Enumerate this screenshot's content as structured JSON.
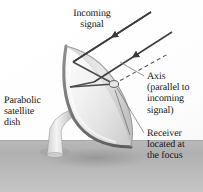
{
  "figure": {
    "background_color": "#ffffff",
    "ground_color": "#b4b4b4",
    "ink_color": "#141414",
    "dish_color": "#e8e8e8",
    "ray_color": "#4a4a4a"
  },
  "labels": {
    "incoming_signal": "Incoming\nsignal",
    "parabolic_dish": "Parabolic\nsatellite\ndish",
    "axis": "Axis\n(parallel to\nincoming\nsignal)",
    "receiver": "Receiver\nlocated at\nthe focus"
  },
  "diagram_parts": {
    "ray_1": "incoming-ray-upper",
    "ray_2": "incoming-ray-lower",
    "reflected_1": "reflected-ray-upper",
    "reflected_2": "reflected-ray-lower",
    "axis_line": "dashed-axis-line",
    "focus": "focus-point",
    "dish": "parabolic-dish-surface",
    "pedestal": "dish-pedestal-stand",
    "ground": "ground-plane",
    "shadow": "dish-ground-shadow"
  }
}
